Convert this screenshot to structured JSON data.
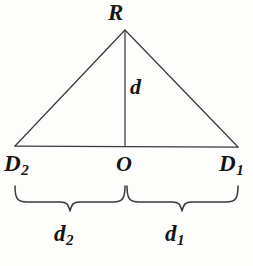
{
  "figure": {
    "background_color": "#fdfdfc",
    "stroke_color": "#3a3a3a",
    "text_color": "#151515",
    "width": 253,
    "height": 266
  },
  "labels": {
    "apex": "R",
    "left_vertex_base": "D",
    "left_vertex_sub": "2",
    "origin": "O",
    "right_vertex_base": "D",
    "right_vertex_sub": "1",
    "altitude": "d",
    "left_span_base": "d",
    "left_span_sub": "2",
    "right_span_base": "d",
    "right_span_sub": "1"
  },
  "geometry": {
    "apex": {
      "x": 125,
      "y": 30
    },
    "left_vertex": {
      "x": 15,
      "y": 146
    },
    "right_vertex": {
      "x": 238,
      "y": 147
    },
    "foot_of_altitude": {
      "x": 125,
      "y": 146
    },
    "left_brace": {
      "x_start": 14,
      "x_end": 125,
      "y_top": 186,
      "y_point": 212
    },
    "right_brace": {
      "x_start": 126,
      "x_end": 238,
      "y_top": 186,
      "y_point": 212
    }
  }
}
